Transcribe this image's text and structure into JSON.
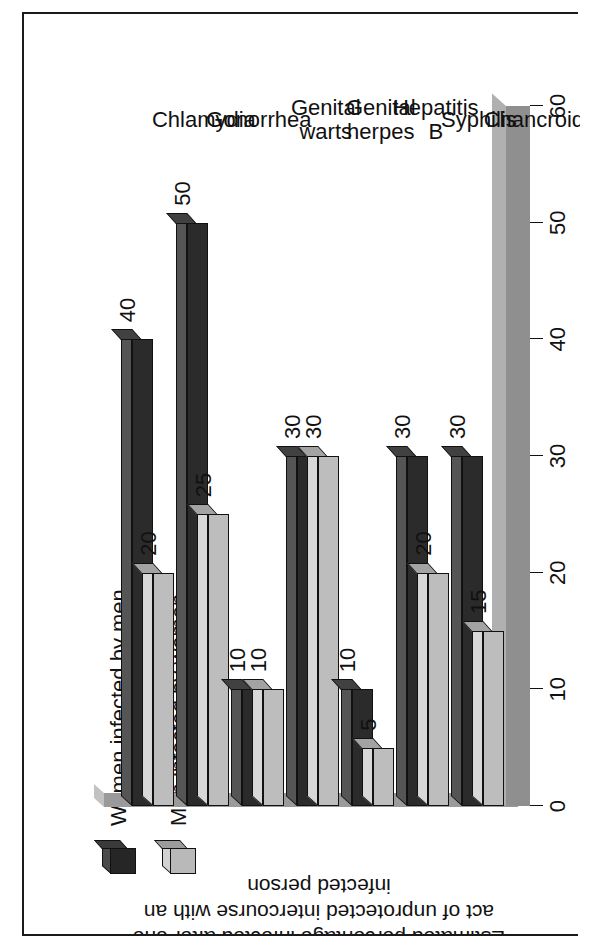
{
  "chart_data": {
    "type": "bar",
    "title": "",
    "orientation": "horizontal-3d",
    "xlabel": "",
    "ylabel": "Estimated percentage infected after one act of unprotected intercourse with an infected person",
    "ylim": [
      0,
      60
    ],
    "ticks": [
      "0",
      "10",
      "20",
      "30",
      "40",
      "50",
      "60"
    ],
    "tick_values": [
      0,
      10,
      20,
      30,
      40,
      50,
      60
    ],
    "grid": false,
    "legend_position": "top-left",
    "categories": [
      "Chlamydia",
      "Gonorrhea",
      "Genital\nwarts",
      "Genital\nherpes",
      "Hepatitis\nB",
      "Syphilis",
      "Chancroid"
    ],
    "series": [
      {
        "name": "Women infected by men",
        "color": "#2b2b2b",
        "values": [
          40,
          50,
          10,
          30,
          10,
          30,
          30
        ],
        "labels": [
          "40",
          "50",
          "10",
          "30",
          "10",
          "30",
          "30"
        ]
      },
      {
        "name": "Men infected by women",
        "color": "#bdbdbd",
        "values": [
          20,
          25,
          10,
          30,
          5,
          20,
          15
        ],
        "labels": [
          "20",
          "25",
          "10",
          "30",
          "5",
          "20",
          "15"
        ]
      }
    ]
  },
  "legend": {
    "items": [
      {
        "label": "Women infected by men",
        "swatch": "dark-cube-icon"
      },
      {
        "label": "Men infected by women",
        "swatch": "light-cube-icon"
      }
    ]
  },
  "colors": {
    "series_dark": "#2b2b2b",
    "series_light": "#bdbdbd",
    "floor": "#b4b4b4",
    "axis_band": "#8f8f8f",
    "frame_border": "#1a1a1a",
    "background": "#ffffff",
    "text": "#111111"
  }
}
